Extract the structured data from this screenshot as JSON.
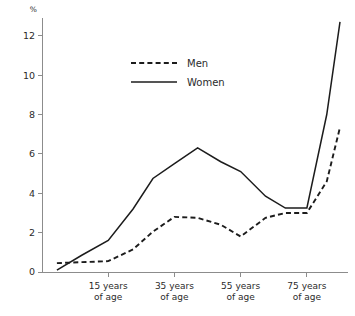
{
  "chart_data": {
    "type": "line",
    "title": "",
    "subtitle": "",
    "xlabel": "",
    "ylabel": "%",
    "unit_label": "%",
    "ylim": [
      0,
      12.8
    ],
    "xlim": [
      0,
      9
    ],
    "grid": false,
    "legend_position": "upper-center",
    "y_ticks": [
      0,
      2,
      4,
      6,
      8,
      10,
      12
    ],
    "y_tick_labels": [
      "0",
      "2",
      "4",
      "6",
      "8",
      "10",
      "12"
    ],
    "x_tick_positions": [
      2,
      4,
      6,
      8
    ],
    "x_tick_labels": [
      {
        "line1": "15 years",
        "line2": "of age"
      },
      {
        "line1": "35 years",
        "line2": "of age"
      },
      {
        "line1": "55 years",
        "line2": "of age"
      },
      {
        "line1": "75 years",
        "line2": "of age"
      }
    ],
    "x": [
      0.45,
      1.2,
      2.0,
      2.75,
      3.35,
      4.0,
      4.7,
      5.4,
      6.0,
      6.75,
      7.35,
      8.0,
      8.6,
      9.0
    ],
    "series": [
      {
        "name": "Men",
        "style": "dashed",
        "color": "#1c1c1c",
        "values": [
          0.45,
          0.5,
          0.55,
          1.15,
          2.05,
          2.8,
          2.75,
          2.4,
          1.8,
          2.75,
          3.0,
          3.0,
          4.6,
          7.35
        ]
      },
      {
        "name": "Women",
        "style": "solid",
        "color": "#1c1c1c",
        "values": [
          0.1,
          0.85,
          1.6,
          3.2,
          4.75,
          5.5,
          6.3,
          5.6,
          5.1,
          3.85,
          3.25,
          3.25,
          8.0,
          12.7
        ]
      }
    ],
    "legend": [
      {
        "label": "Men",
        "style": "dashed"
      },
      {
        "label": "Women",
        "style": "solid"
      }
    ]
  },
  "legend": {
    "men_label": "Men",
    "women_label": "Women"
  }
}
